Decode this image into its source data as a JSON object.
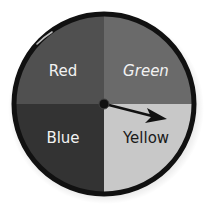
{
  "spinner": {
    "sections": [
      {
        "label": "Red",
        "fill": "#505050",
        "text_color": "#f2f2f2"
      },
      {
        "label": "Green",
        "fill": "#6a6a6a",
        "text_color": "#f2f2f2"
      },
      {
        "label": "Blue",
        "fill": "#333333",
        "text_color": "#f2f2f2"
      },
      {
        "label": "Yellow",
        "fill": "#c8c8c8",
        "text_color": "#1a1a1a"
      }
    ],
    "pointer_landed_on": "Yellow",
    "rim_color": "#111111"
  }
}
